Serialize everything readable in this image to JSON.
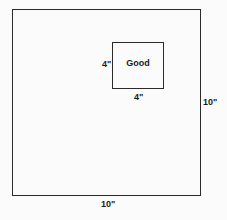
{
  "diagram": {
    "outer_square": {
      "width_label": "10\"",
      "height_label": "10\""
    },
    "inner_square": {
      "label": "Good",
      "width_label": "4\"",
      "height_label": "4\""
    }
  }
}
